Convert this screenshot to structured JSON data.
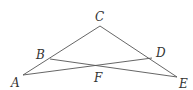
{
  "diagram": {
    "type": "geometry",
    "points": {
      "A": {
        "label": "A",
        "x": 23,
        "y": 75
      },
      "B": {
        "label": "B",
        "x": 50,
        "y": 59
      },
      "C": {
        "label": "C",
        "x": 100,
        "y": 26
      },
      "D": {
        "label": "D",
        "x": 152,
        "y": 58
      },
      "E": {
        "label": "E",
        "x": 177,
        "y": 77
      },
      "F": {
        "label": "F",
        "x": 99,
        "y": 67
      }
    },
    "segments": [
      [
        "A",
        "C"
      ],
      [
        "C",
        "E"
      ],
      [
        "B",
        "E"
      ],
      [
        "A",
        "D"
      ]
    ],
    "stroke_color": "#555555",
    "label_color": "#333333"
  }
}
